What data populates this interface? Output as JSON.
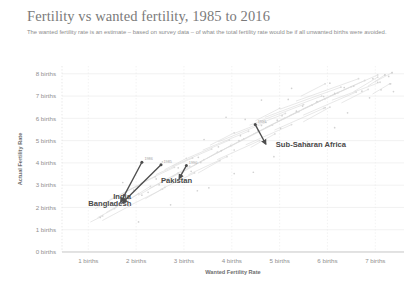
{
  "chart_data": {
    "type": "scatter",
    "title": "Fertility vs wanted fertility, 1985 to 2016",
    "subtitle": "The wanted fertility rate is an estimate – based on survey data – of what the total fertility rate would be if all unwanted births were avoided.",
    "xlabel": "Wanted Fertility Rate",
    "ylabel": "Actual Fertility Rate",
    "xlim": [
      0.45,
      7.6
    ],
    "ylim": [
      0,
      8.35
    ],
    "xticks": [
      1,
      2,
      3,
      4,
      5,
      6,
      7
    ],
    "yticks": [
      0,
      1,
      2,
      3,
      4,
      5,
      6,
      7,
      8
    ],
    "xtick_labels": [
      "1 births",
      "2 births",
      "3 births",
      "4 births",
      "5 births",
      "6 births",
      "7 births"
    ],
    "ytick_labels": [
      "0 births",
      "1 births",
      "2 births",
      "3 births",
      "4 births",
      "5 births",
      "6 births",
      "7 births",
      "8 births"
    ],
    "grid": true,
    "legend": "none",
    "accent_color": "#4d4d4d",
    "faint_color": "#dcdcdc",
    "grid_color": "#e9e9e9",
    "highlighted_series": [
      {
        "name": "India",
        "start_year": "1986",
        "end_year": "2016",
        "points": [
          {
            "x": 2.12,
            "y": 4.03,
            "year": "1986"
          },
          {
            "x": 1.68,
            "y": 2.25,
            "year": "2016"
          }
        ]
      },
      {
        "name": "Bangladesh",
        "start_year": "1985",
        "end_year": "2014",
        "points": [
          {
            "x": 2.52,
            "y": 3.92,
            "year": "1985"
          },
          {
            "x": 1.72,
            "y": 2.22,
            "year": "2014"
          }
        ]
      },
      {
        "name": "Pakistan",
        "start_year": "1990",
        "end_year": "2013",
        "points": [
          {
            "x": 3.05,
            "y": 3.88,
            "year": "1990"
          },
          {
            "x": 2.9,
            "y": 3.3,
            "year": "2013"
          }
        ]
      },
      {
        "name": "Sub-Saharan Africa",
        "start_year": "1991",
        "end_year": "2016",
        "points": [
          {
            "x": 4.49,
            "y": 5.72,
            "year": "1991"
          },
          {
            "x": 4.71,
            "y": 4.85,
            "year": "2016"
          }
        ]
      }
    ],
    "annotations": [
      {
        "label": "India",
        "x": 1.52,
        "y": 2.4
      },
      {
        "label": "Bangladesh",
        "x": 1.0,
        "y": 2.07
      },
      {
        "label": "Pakistan",
        "x": 2.52,
        "y": 3.08
      },
      {
        "label": "Sub-Saharan Africa",
        "x": 4.92,
        "y": 4.7
      }
    ],
    "background_trajectories": [
      [
        [
          1.05,
          1.35
        ],
        [
          1.3,
          1.62
        ]
      ],
      [
        [
          1.2,
          1.55
        ],
        [
          1.55,
          1.95
        ]
      ],
      [
        [
          1.38,
          1.78
        ],
        [
          1.72,
          2.2
        ]
      ],
      [
        [
          1.6,
          2.05
        ],
        [
          2.05,
          2.62
        ]
      ],
      [
        [
          1.82,
          2.3
        ],
        [
          2.3,
          2.95
        ]
      ],
      [
        [
          2.05,
          2.55
        ],
        [
          2.62,
          3.25
        ]
      ],
      [
        [
          2.28,
          2.85
        ],
        [
          2.88,
          3.55
        ]
      ],
      [
        [
          2.52,
          3.1
        ],
        [
          3.12,
          3.85
        ]
      ],
      [
        [
          2.75,
          3.35
        ],
        [
          3.42,
          4.15
        ]
      ],
      [
        [
          3.0,
          3.62
        ],
        [
          3.7,
          4.48
        ]
      ],
      [
        [
          3.22,
          3.9
        ],
        [
          3.98,
          4.78
        ]
      ],
      [
        [
          3.48,
          4.2
        ],
        [
          4.25,
          5.08
        ]
      ],
      [
        [
          3.7,
          4.45
        ],
        [
          4.55,
          5.4
        ]
      ],
      [
        [
          3.95,
          4.72
        ],
        [
          4.85,
          5.7
        ]
      ],
      [
        [
          4.2,
          5.02
        ],
        [
          5.1,
          6.0
        ]
      ],
      [
        [
          4.45,
          5.3
        ],
        [
          5.4,
          6.3
        ]
      ],
      [
        [
          4.7,
          5.58
        ],
        [
          5.68,
          6.6
        ]
      ],
      [
        [
          4.95,
          5.85
        ],
        [
          5.95,
          6.88
        ]
      ],
      [
        [
          5.2,
          6.12
        ],
        [
          6.22,
          7.15
        ]
      ],
      [
        [
          5.48,
          6.42
        ],
        [
          6.5,
          7.42
        ]
      ],
      [
        [
          5.75,
          6.7
        ],
        [
          6.78,
          7.7
        ]
      ],
      [
        [
          6.05,
          7.0
        ],
        [
          7.05,
          7.95
        ]
      ],
      [
        [
          1.15,
          1.95
        ],
        [
          1.62,
          2.52
        ]
      ],
      [
        [
          1.45,
          2.35
        ],
        [
          2.02,
          2.95
        ]
      ],
      [
        [
          1.78,
          2.72
        ],
        [
          2.4,
          3.38
        ]
      ],
      [
        [
          2.1,
          3.1
        ],
        [
          2.8,
          3.8
        ]
      ],
      [
        [
          2.42,
          3.48
        ],
        [
          3.18,
          4.22
        ]
      ],
      [
        [
          2.75,
          3.85
        ],
        [
          3.58,
          4.62
        ]
      ],
      [
        [
          3.08,
          4.22
        ],
        [
          3.95,
          5.02
        ]
      ],
      [
        [
          3.4,
          4.58
        ],
        [
          4.35,
          5.42
        ]
      ],
      [
        [
          3.72,
          4.95
        ],
        [
          4.72,
          5.82
        ]
      ],
      [
        [
          4.05,
          5.32
        ],
        [
          5.12,
          6.22
        ]
      ],
      [
        [
          4.38,
          5.7
        ],
        [
          5.5,
          6.62
        ]
      ],
      [
        [
          4.7,
          6.05
        ],
        [
          5.88,
          7.0
        ]
      ],
      [
        [
          5.02,
          6.42
        ],
        [
          6.28,
          7.4
        ]
      ],
      [
        [
          5.35,
          6.78
        ],
        [
          6.65,
          7.78
        ]
      ],
      [
        [
          1.3,
          1.42
        ],
        [
          1.85,
          2.05
        ]
      ],
      [
        [
          1.9,
          2.12
        ],
        [
          2.55,
          2.82
        ]
      ],
      [
        [
          2.5,
          2.8
        ],
        [
          3.22,
          3.55
        ]
      ],
      [
        [
          3.1,
          3.48
        ],
        [
          3.9,
          4.28
        ]
      ],
      [
        [
          3.7,
          4.15
        ],
        [
          4.58,
          5.0
        ]
      ],
      [
        [
          4.3,
          4.82
        ],
        [
          5.25,
          5.72
        ]
      ],
      [
        [
          4.9,
          5.48
        ],
        [
          5.92,
          6.45
        ]
      ],
      [
        [
          5.5,
          6.15
        ],
        [
          6.6,
          7.18
        ]
      ],
      [
        [
          6.1,
          6.82
        ],
        [
          7.1,
          7.62
        ]
      ],
      [
        [
          6.55,
          7.2
        ],
        [
          7.05,
          7.85
        ]
      ],
      [
        [
          2.2,
          2.4
        ],
        [
          2.6,
          2.9
        ]
      ],
      [
        [
          3.3,
          3.55
        ],
        [
          3.75,
          4.1
        ]
      ],
      [
        [
          4.4,
          4.7
        ],
        [
          4.9,
          5.3
        ]
      ],
      [
        [
          5.5,
          5.85
        ],
        [
          6.05,
          6.5
        ]
      ],
      [
        [
          6.3,
          6.7
        ],
        [
          6.85,
          7.3
        ]
      ],
      [
        [
          1.7,
          2.6
        ],
        [
          2.1,
          3.05
        ]
      ],
      [
        [
          2.6,
          3.7
        ],
        [
          3.05,
          4.2
        ]
      ],
      [
        [
          3.55,
          4.8
        ],
        [
          4.05,
          5.35
        ]
      ],
      [
        [
          4.5,
          5.9
        ],
        [
          5.0,
          6.45
        ]
      ],
      [
        [
          5.45,
          7.0
        ],
        [
          5.95,
          7.55
        ]
      ],
      [
        [
          6.85,
          7.45
        ],
        [
          7.2,
          7.95
        ]
      ],
      [
        [
          6.95,
          7.1
        ],
        [
          7.3,
          7.55
        ]
      ],
      [
        [
          7.0,
          7.65
        ],
        [
          7.35,
          8.05
        ]
      ]
    ],
    "background_points": [
      [
        1.25,
        1.55
      ],
      [
        1.58,
        2.02
      ],
      [
        2.12,
        2.55
      ],
      [
        2.48,
        3.02
      ],
      [
        2.95,
        3.55
      ],
      [
        3.35,
        4.02
      ],
      [
        3.78,
        4.55
      ],
      [
        4.15,
        5.0
      ],
      [
        4.55,
        5.45
      ],
      [
        4.95,
        5.92
      ],
      [
        5.35,
        6.32
      ],
      [
        5.78,
        6.75
      ],
      [
        6.15,
        7.12
      ],
      [
        6.55,
        7.45
      ],
      [
        6.95,
        7.78
      ],
      [
        7.2,
        7.95
      ],
      [
        1.42,
        2.25
      ],
      [
        1.95,
        2.78
      ],
      [
        2.42,
        3.28
      ],
      [
        2.88,
        3.78
      ],
      [
        3.3,
        4.25
      ],
      [
        3.72,
        4.72
      ],
      [
        4.18,
        5.22
      ],
      [
        4.62,
        5.68
      ],
      [
        5.05,
        6.12
      ],
      [
        5.48,
        6.55
      ],
      [
        5.92,
        6.98
      ],
      [
        6.35,
        7.38
      ],
      [
        2.25,
        2.68
      ],
      [
        3.15,
        3.62
      ],
      [
        4.05,
        4.58
      ],
      [
        5.02,
        5.55
      ],
      [
        5.95,
        6.48
      ],
      [
        6.72,
        7.22
      ],
      [
        7.05,
        7.62
      ],
      [
        7.28,
        7.88
      ],
      [
        1.72,
        3.12
      ],
      [
        2.55,
        4.05
      ],
      [
        3.42,
        5.05
      ],
      [
        4.28,
        5.95
      ],
      [
        5.18,
        6.85
      ],
      [
        6.05,
        7.58
      ],
      [
        2.05,
        1.35
      ],
      [
        2.72,
        2.12
      ],
      [
        3.52,
        2.88
      ],
      [
        4.45,
        3.58
      ],
      [
        3.88,
        6.05
      ],
      [
        4.62,
        6.82
      ],
      [
        5.25,
        7.35
      ],
      [
        6.42,
        6.25
      ],
      [
        6.88,
        6.92
      ],
      [
        7.12,
        7.28
      ],
      [
        7.32,
        7.55
      ],
      [
        7.35,
        8.05
      ],
      [
        7.38,
        7.2
      ],
      [
        6.15,
        5.58
      ],
      [
        5.58,
        4.95
      ],
      [
        4.88,
        4.28
      ],
      [
        4.05,
        3.52
      ],
      [
        3.28,
        2.75
      ]
    ]
  }
}
